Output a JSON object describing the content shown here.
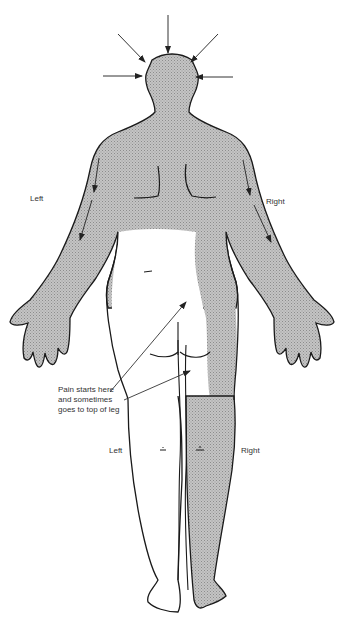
{
  "figure": {
    "view": "posterior",
    "colors": {
      "shade": "#b9b9b9",
      "outline": "#1a1a1a",
      "arrow": "#333333",
      "text": "#333333",
      "background": "#ffffff"
    }
  },
  "labels": {
    "upper_left": "Left",
    "upper_right": "Right",
    "lower_left": "Left",
    "lower_right": "Right"
  },
  "annotation": {
    "lines": [
      "Pain starts here",
      "and sometimes",
      "goes to top of leg"
    ]
  },
  "arrows": {
    "head": [
      "top",
      "upper-left",
      "upper-right",
      "left",
      "right"
    ],
    "arms": [
      "left-arm-down",
      "right-arm-down"
    ],
    "pointer": [
      "to-lower-back",
      "to-top-of-leg"
    ]
  }
}
